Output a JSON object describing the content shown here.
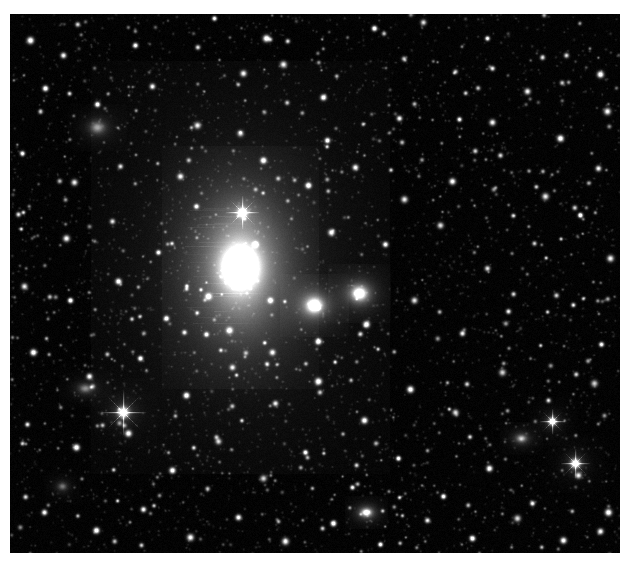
{
  "image": {
    "title": "Deep sky optical image",
    "subject": "Bright elliptical galaxy with companions in a dense star field",
    "caption": "",
    "frame": {
      "canvas_width": 637,
      "canvas_height": 569,
      "border_color": "#ffffff",
      "sky_left": 10,
      "sky_top": 14,
      "sky_width": 610,
      "sky_height": 539,
      "background_color": "#000000",
      "sky_noise_color": "#0a0a0a",
      "star_color": "#ffffff"
    },
    "palette": {
      "black": "#000000",
      "white": "#ffffff",
      "dim_gray": "#3a3a3a",
      "halo_gray": "#9a9a9a"
    },
    "objects": {
      "dominant_galaxy": {
        "name": "central-elliptical-galaxy",
        "cx": 240,
        "cy": 267,
        "core_radius": 17,
        "halo_radius_x": 52,
        "halo_radius_y": 72,
        "peak_brightness": 255,
        "description": "saturated white nucleus with extended slightly north-south elongated halo"
      },
      "companions": [
        {
          "name": "companion-galaxy-a",
          "cx": 314,
          "cy": 305,
          "rx": 13,
          "ry": 12,
          "peak": 238
        },
        {
          "name": "companion-galaxy-b",
          "cx": 359,
          "cy": 293,
          "rx": 12,
          "ry": 11,
          "peak": 228
        },
        {
          "name": "faint-galaxy-upper-left",
          "cx": 97,
          "cy": 127,
          "rx": 11,
          "ry": 9,
          "peak": 96
        },
        {
          "name": "faint-galaxy-left",
          "cx": 85,
          "cy": 388,
          "rx": 10,
          "ry": 7,
          "peak": 84
        },
        {
          "name": "irregular-patch-lower-center",
          "cx": 366,
          "cy": 512,
          "rx": 8,
          "ry": 6,
          "peak": 210
        },
        {
          "name": "faint-galaxy-lower-left",
          "cx": 62,
          "cy": 486,
          "rx": 7,
          "ry": 6,
          "peak": 70
        },
        {
          "name": "faint-galaxy-upper-right",
          "cx": 521,
          "cy": 438,
          "rx": 8,
          "ry": 6,
          "peak": 120
        }
      ],
      "spike_stars": [
        {
          "name": "bright-star-diffraction-lower-left",
          "cx": 123,
          "cy": 412,
          "radius": 7,
          "spike": 22
        },
        {
          "name": "bright-star-diffraction-above-galaxy",
          "cx": 242,
          "cy": 212,
          "radius": 6,
          "spike": 16
        },
        {
          "name": "bright-star-diffraction-lower-right",
          "cx": 575,
          "cy": 463,
          "radius": 6,
          "spike": 14
        },
        {
          "name": "bright-star-diffraction-right",
          "cx": 552,
          "cy": 421,
          "radius": 5,
          "spike": 12
        }
      ],
      "star_counts": {
        "bright": 46,
        "medium": 150,
        "faint": 420
      }
    }
  }
}
